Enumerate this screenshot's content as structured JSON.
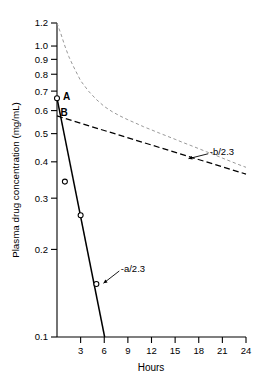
{
  "chart_data": {
    "type": "line",
    "title": "",
    "subtitle": "",
    "xlabel": "Hours",
    "ylabel": "Plasma drug concentration (mg/mL)",
    "yscale": "log",
    "xscale": "linear",
    "xlim": [
      0,
      24
    ],
    "ylim": [
      0.1,
      1.2
    ],
    "grid": false,
    "legend_position": "none",
    "xticks": [
      3,
      6,
      9,
      12,
      15,
      18,
      21,
      24
    ],
    "xticklabels": [
      "3",
      "6",
      "9",
      "12",
      "15",
      "18",
      "21",
      "24"
    ],
    "yticks": [
      0.1,
      0.2,
      0.3,
      0.4,
      0.5,
      0.6,
      0.7,
      0.8,
      0.9,
      1.0,
      1.2
    ],
    "yticklabels": [
      "0.1",
      "0.2",
      "0.3",
      "0.4",
      "0.5",
      "0.6",
      "0.7",
      "0.8",
      "0.9",
      "1.0",
      "1.2"
    ],
    "series": [
      {
        "name": "observed-plasma-concentration-curve",
        "style": "dashed-light",
        "color": "#999999",
        "x": [
          0.0,
          0.5,
          1.0,
          1.5,
          2.0,
          3.0,
          4.0,
          5.0,
          6.0,
          7.0,
          8.0,
          9.0,
          10.0,
          11.0,
          12.0,
          13.0,
          14.0,
          15.0,
          16.0,
          17.0,
          18.0,
          19.0,
          20.0,
          21.0,
          22.0,
          23.0,
          24.0
        ],
        "y": [
          1.23,
          1.1,
          1.0,
          0.92,
          0.86,
          0.76,
          0.7,
          0.655,
          0.62,
          0.595,
          0.575,
          0.558,
          0.543,
          0.528,
          0.515,
          0.502,
          0.49,
          0.478,
          0.466,
          0.455,
          0.444,
          0.433,
          0.423,
          0.412,
          0.402,
          0.392,
          0.383
        ]
      },
      {
        "name": "terminal-elimination-line-B",
        "style": "dashed-bold",
        "color": "#000000",
        "x": [
          0,
          24
        ],
        "y": [
          0.575,
          0.363
        ],
        "intercept_label": "B",
        "slope_label": "-b/2.3"
      },
      {
        "name": "residual-distribution-line-A",
        "style": "solid",
        "color": "#000000",
        "x": [
          0,
          6.05
        ],
        "y": [
          0.662,
          0.1
        ],
        "intercept_label": "A",
        "slope_label": "-a/2.3"
      }
    ],
    "points": [
      {
        "name": "residual-point-0",
        "x": 0.0,
        "y": 0.662,
        "marker": "open-circle",
        "on_line": true
      },
      {
        "name": "residual-point-1",
        "x": 1.0,
        "y": 0.342,
        "marker": "open-circle",
        "on_line": false
      },
      {
        "name": "residual-point-2",
        "x": 3.0,
        "y": 0.262,
        "marker": "open-circle",
        "on_line": true
      },
      {
        "name": "residual-point-3",
        "x": 5.0,
        "y": 0.152,
        "marker": "open-circle",
        "on_line": true
      }
    ],
    "annotations": [
      {
        "name": "slope-b-annotation",
        "text": "-b/2.3",
        "x": 19.4,
        "y": 0.435,
        "arrow_to_x": 16.7,
        "arrow_to_y": 0.41
      },
      {
        "name": "slope-a-annotation",
        "text": "-a/2.3",
        "x": 8.1,
        "y": 0.172,
        "arrow_to_x": 5.9,
        "arrow_to_y": 0.153
      },
      {
        "name": "intercept-A-label",
        "text": "A",
        "x": 0.75,
        "y": 0.672
      },
      {
        "name": "intercept-B-label",
        "text": "B",
        "x": 0.45,
        "y": 0.59
      }
    ]
  },
  "figure": {
    "axis_color": "#000000",
    "background": "#ffffff",
    "curve_color": "#999999",
    "line_color": "#000000"
  }
}
